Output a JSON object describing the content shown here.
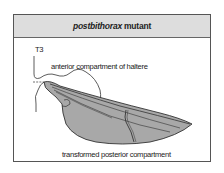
{
  "panel": {
    "title_italic": "postbithorax",
    "title_rest": "mutant"
  },
  "labels": {
    "segment": "T3",
    "anterior": "anterior compartment of haltere",
    "posterior": "transformed posterior compartment"
  },
  "colors": {
    "header_bg": "#dddddd",
    "frame_border": "#555555",
    "wing_fill": "#a8a8a8",
    "line": "#333333"
  }
}
